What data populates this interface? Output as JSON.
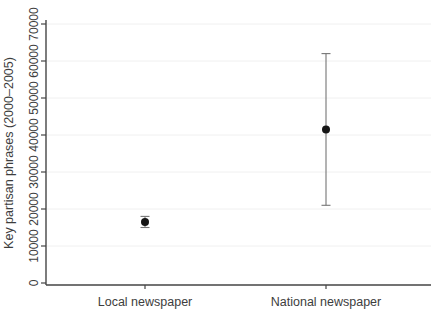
{
  "chart_data": {
    "type": "scatter",
    "subtype": "point-estimates-with-error-bars",
    "title": "",
    "xlabel": "",
    "ylabel": "Key partisan phrases (2000–2005)",
    "categories": [
      "Local newspaper",
      "National newspaper"
    ],
    "series": [
      {
        "name": "Key partisan phrases (2000–2005)",
        "values": [
          16500,
          41500
        ],
        "ci_low": [
          15000,
          21000
        ],
        "ci_high": [
          18000,
          62000
        ]
      }
    ],
    "ylim": [
      0,
      70000
    ],
    "yticks": [
      0,
      10000,
      20000,
      30000,
      40000,
      50000,
      60000,
      70000
    ],
    "ytick_labels": [
      "0",
      "10000",
      "20000",
      "30000",
      "40000",
      "50000",
      "60000",
      "70000"
    ],
    "ytick_label_orientation": "rotated-90-ccw",
    "grid": "faint-horizontal-at-yticks",
    "legend_position": "none",
    "colors": {
      "background": "#ffffff",
      "axis": "#454545",
      "text": "#3d3d3d",
      "marker": "#151515",
      "error_bar": "#757575",
      "gridline": "#f0f0f0"
    }
  }
}
